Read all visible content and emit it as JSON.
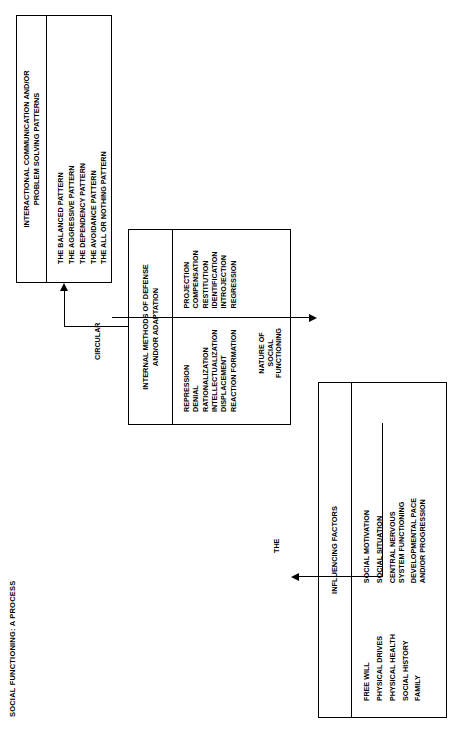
{
  "title": "SOCIAL FUNCTIONING:  A PROCESS",
  "boxes": {
    "defense": {
      "header_line1": "INTERNAL METHODS OF DEFENSE",
      "header_line2": "AND/OR ADAPTATION",
      "column_left": [
        "REPRESSION",
        "DENIAL",
        "RATIONALIZATION",
        "INTELLECTUALIZATION",
        "DISPLACEMENT",
        "REACTION FORMATION"
      ],
      "column_right": [
        "PROJECTION",
        "COMPENSATION",
        "RESTITUTION",
        "IDENTIFICATION",
        "INTROJECTION",
        "REGRESSION"
      ]
    },
    "interactional": {
      "header_line1": "INTERACTIONAL COMMUNICATION AND/OR",
      "header_line2": "PROBLEM SOLVING PATTERNS",
      "items": [
        "THE BALANCED PATTERN",
        "THE AGGRESSIVE PATTERN",
        "THE DEPENDENCY PATTERN",
        "THE AVOIDANCE PATTERN",
        "THE ALL OR NOTHING PATTERN"
      ]
    },
    "influencing": {
      "header": "INFLUENCING FACTORS",
      "column_left": [
        "FREE WILL",
        "PHYSICAL DRIVES",
        "PHYSICAL HEALTH",
        "SOCIAL HISTORY",
        "FAMILY"
      ],
      "column_right": [
        "SOCIAL MOTIVATION",
        "SOCIAL SITUATION",
        "CENTRAL NERVOUS\nSYSTEM FUNCTIONING",
        "DEVELOPMENTAL PACE\nAND/OR PROGRESSION"
      ]
    }
  },
  "edges": {
    "circular": "CIRCULAR",
    "the": "THE",
    "nature_line1": "NATURE OF",
    "nature_line2": "SOCIAL",
    "nature_line3": "FUNCTIONING"
  },
  "colors": {
    "ink": "#000000",
    "paper": "#ffffff"
  }
}
